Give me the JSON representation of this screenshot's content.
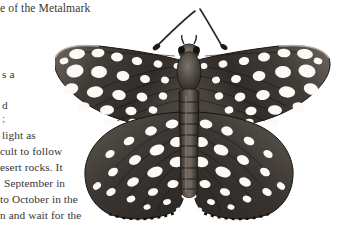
{
  "page": {
    "background_color": "#ffffff",
    "text_color": "#3a3632",
    "width": 363,
    "height": 238
  },
  "heading": {
    "text": "e of the Metalmark"
  },
  "body_text": {
    "lines": [
      {
        "text": "s a",
        "x": 2,
        "y": 69,
        "style": "normal"
      },
      {
        "text": "d",
        "x": 2,
        "y": 100,
        "style": "normal"
      },
      {
        "text": ";",
        "x": 2,
        "y": 115,
        "style": "faint"
      },
      {
        "text": "light as",
        "x": 2,
        "y": 131,
        "style": "normal"
      },
      {
        "text": "cult to follow",
        "x": 0,
        "y": 147,
        "style": "normal"
      },
      {
        "text": "esert rocks. It",
        "x": 0,
        "y": 163,
        "style": "normal"
      },
      {
        "text": "September in",
        "x": 4,
        "y": 179,
        "style": "normal"
      },
      {
        "text": "to October in the",
        "x": 0,
        "y": 195,
        "style": "normal"
      },
      {
        "text": "n and wait for the",
        "x": 0,
        "y": 211,
        "style": "normal"
      }
    ]
  },
  "figure": {
    "colors": {
      "wing_dark": "#2b2724",
      "wing_mid": "#5a534d",
      "wing_light": "#8d867f",
      "spot_white": "#ffffff",
      "spot_cream": "#f2efe9",
      "body_dark": "#3b3531",
      "outline": "#1a1715"
    }
  }
}
